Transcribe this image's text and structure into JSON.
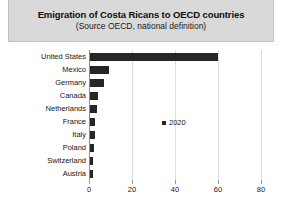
{
  "header": {
    "title": "Emigration of Costa Ricans to OECD countries",
    "subtitle": "(Source OECD, national definition)"
  },
  "legend": {
    "position": "center",
    "entries": [
      {
        "label": "2020",
        "color": "#262626",
        "marker": "square"
      }
    ]
  },
  "colors": {
    "bar": "#262626",
    "title_band": "#d9d9d9",
    "gridline": "#dcdcdc",
    "axis": "#8c8c8c",
    "plot_background": "#ffffff"
  },
  "chart_data": {
    "type": "bar",
    "orientation": "horizontal",
    "title": "Emigration of Costa Ricans to OECD countries",
    "subtitle": "(Source OECD, national definition)",
    "xlabel": "",
    "ylabel": "",
    "xlim": [
      0,
      80
    ],
    "xticks": [
      0,
      20,
      40,
      60,
      80
    ],
    "xticklabels": [
      "0",
      "20",
      "40",
      "60",
      "80"
    ],
    "grid": true,
    "grid_axis": "x",
    "legend_position": "center",
    "categories": [
      "United States",
      "Mexico",
      "Germany",
      "Canada",
      "Netherlands",
      "France",
      "Italy",
      "Poland",
      "Switzerland",
      "Austria"
    ],
    "series": [
      {
        "name": "2020",
        "color": "#262626",
        "values": [
          60,
          9.3,
          7,
          4.3,
          3.8,
          3,
          2.6,
          2.2,
          2,
          1.7
        ]
      }
    ]
  }
}
